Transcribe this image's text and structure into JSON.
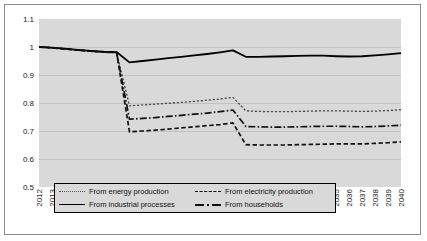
{
  "chart_data": {
    "type": "line",
    "title": "",
    "xlabel": "",
    "ylabel": "",
    "ylim": [
      0.5,
      1.1
    ],
    "yticks": [
      "1.1",
      "1",
      "0.9",
      "0.8",
      "0.7",
      "0.6",
      "0.5"
    ],
    "grid": true,
    "legend_position": "bottom-inside",
    "x": [
      "2012",
      "2013",
      "2014",
      "2015",
      "2016",
      "2017",
      "2018",
      "2019",
      "2020",
      "2021",
      "2022",
      "2023",
      "2024",
      "2025",
      "2026",
      "2027",
      "2028",
      "2029",
      "2030",
      "2031",
      "2032",
      "2033",
      "2034",
      "2035",
      "2036",
      "2037",
      "2038",
      "2039",
      "2040"
    ],
    "series": [
      {
        "name": "From energy production",
        "style": "dotted",
        "values": [
          1.0,
          0.997,
          0.993,
          0.989,
          0.985,
          0.982,
          0.98,
          0.79,
          0.793,
          0.796,
          0.799,
          0.802,
          0.806,
          0.81,
          0.814,
          0.82,
          0.772,
          0.77,
          0.769,
          0.769,
          0.77,
          0.771,
          0.772,
          0.772,
          0.771,
          0.77,
          0.771,
          0.773,
          0.776
        ]
      },
      {
        "name": "From electricity production",
        "style": "dashed",
        "values": [
          1.0,
          0.997,
          0.993,
          0.989,
          0.985,
          0.982,
          0.98,
          0.697,
          0.7,
          0.703,
          0.707,
          0.711,
          0.715,
          0.719,
          0.723,
          0.729,
          0.651,
          0.65,
          0.65,
          0.65,
          0.651,
          0.652,
          0.653,
          0.654,
          0.654,
          0.654,
          0.656,
          0.658,
          0.661
        ]
      },
      {
        "name": "From industrial processes",
        "style": "solid",
        "values": [
          1.0,
          0.998,
          0.994,
          0.99,
          0.986,
          0.983,
          0.982,
          0.945,
          0.95,
          0.955,
          0.96,
          0.965,
          0.97,
          0.975,
          0.981,
          0.988,
          0.965,
          0.965,
          0.966,
          0.967,
          0.968,
          0.969,
          0.969,
          0.967,
          0.966,
          0.967,
          0.97,
          0.974,
          0.978
        ]
      },
      {
        "name": "From households",
        "style": "dashdot",
        "values": [
          1.0,
          0.997,
          0.993,
          0.989,
          0.985,
          0.982,
          0.98,
          0.742,
          0.745,
          0.748,
          0.752,
          0.756,
          0.76,
          0.764,
          0.769,
          0.775,
          0.716,
          0.715,
          0.714,
          0.714,
          0.715,
          0.716,
          0.717,
          0.717,
          0.716,
          0.715,
          0.716,
          0.718,
          0.721
        ]
      }
    ]
  },
  "legend": {
    "items": [
      {
        "label": "From energy production"
      },
      {
        "label": "From electricity production"
      },
      {
        "label": "From industrial processes"
      },
      {
        "label": "From households"
      }
    ]
  }
}
